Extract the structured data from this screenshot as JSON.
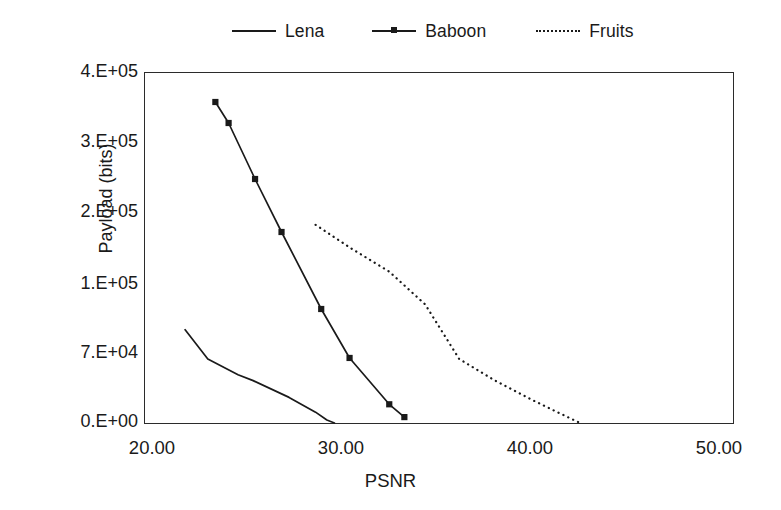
{
  "chart_data": {
    "type": "line",
    "title": "",
    "xlabel": "PSNR",
    "ylabel": "Payload (bits)",
    "xlim": [
      20.0,
      50.0
    ],
    "ylim": [
      0,
      400000
    ],
    "grid": false,
    "legend_position": "top",
    "xticks": [
      "20.00",
      "30.00",
      "40.00",
      "50.00"
    ],
    "xtick_values": [
      20.0,
      30.0,
      40.0,
      50.0
    ],
    "yticks": [
      "4.E+05",
      "3.E+05",
      "2.E+05",
      "1.E+05",
      "7.E+04",
      "0.E+00"
    ],
    "ytick_values": [
      400000,
      300000,
      200000,
      100000,
      70000,
      0
    ],
    "series": [
      {
        "name": "Lena",
        "style": "solid",
        "marker": "none",
        "color": "#1a1a1a",
        "x": [
          21.7,
          22.9,
          24.5,
          25.3,
          27.2,
          28.6,
          29.2,
          29.6
        ],
        "y": [
          81000,
          66000,
          50000,
          44000,
          27000,
          12000,
          4000,
          1000
        ]
      },
      {
        "name": "Baboon",
        "style": "solid",
        "marker": "square",
        "color": "#1a1a1a",
        "x": [
          23.3,
          24.0,
          25.4,
          26.8,
          28.9,
          30.4,
          32.5,
          33.3
        ],
        "y": [
          360000,
          330000,
          250000,
          175000,
          90000,
          67000,
          20000,
          7000
        ]
      },
      {
        "name": "Fruits",
        "style": "dotted",
        "marker": "none",
        "color": "#1a1a1a",
        "x": [
          28.6,
          30.5,
          32.5,
          34.4,
          36.2,
          38.1,
          40.0,
          41.4,
          42.6
        ],
        "y": [
          185000,
          152000,
          120000,
          92000,
          66000,
          44000,
          25000,
          12000,
          1000
        ]
      }
    ]
  },
  "legend": {
    "entries": [
      {
        "label": "Lena",
        "style": "solid",
        "marker": "none"
      },
      {
        "label": "Baboon",
        "style": "solid",
        "marker": "square"
      },
      {
        "label": "Fruits",
        "style": "dotted",
        "marker": "none"
      }
    ]
  },
  "axes": {
    "y_title": "Payload (bits)",
    "x_title": "PSNR",
    "y_labels": [
      "4.E+05",
      "3.E+05",
      "2.E+05",
      "1.E+05",
      "7.E+04",
      "0.E+00"
    ],
    "x_labels": [
      "20.00",
      "30.00",
      "40.00",
      "50.00"
    ]
  },
  "colors": {
    "line": "#1a1a1a",
    "frame": "#2b2b2b",
    "background": "#ffffff"
  }
}
